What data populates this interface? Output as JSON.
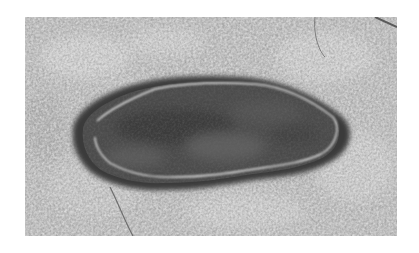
{
  "image": {
    "subject": "Grayscale photograph of a rock surface with an elongated dark oval patch outlined by a thin light rim",
    "colors": {
      "background": "#ffffff",
      "rock": "#b8b8b8",
      "rock_light": "#d6d6d6",
      "patch": "#4a4a4a",
      "patch_edge": "#2e2e2e",
      "rim": "#e8e8e8"
    }
  }
}
